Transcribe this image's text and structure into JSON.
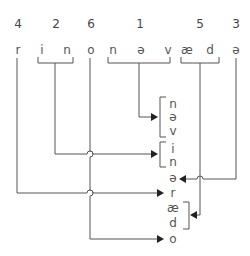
{
  "diagram": {
    "type": "phoneme-reordering",
    "source_row": {
      "order_numbers": [
        {
          "label": "4",
          "x": 18
        },
        {
          "label": "2",
          "x": 56
        },
        {
          "label": "6",
          "x": 91
        },
        {
          "label": "1",
          "x": 140
        },
        {
          "label": "5",
          "x": 200
        },
        {
          "label": "3",
          "x": 236
        }
      ],
      "segments": [
        {
          "text": "r",
          "x": 18
        },
        {
          "text": "i",
          "x": 42
        },
        {
          "text": "n",
          "x": 67
        },
        {
          "text": "o",
          "x": 91
        },
        {
          "text": "n",
          "x": 113
        },
        {
          "text": "ə",
          "x": 141
        },
        {
          "text": "v",
          "x": 168
        },
        {
          "text": "æ",
          "x": 187
        },
        {
          "text": "d",
          "x": 210
        },
        {
          "text": "ə",
          "x": 236
        }
      ]
    },
    "target_column": [
      {
        "text": "n",
        "y": 108,
        "group": "1"
      },
      {
        "text": "ə",
        "y": 121,
        "group": "1"
      },
      {
        "text": "v",
        "y": 135,
        "group": "1"
      },
      {
        "text": "i",
        "y": 153,
        "group": "2"
      },
      {
        "text": "n",
        "y": 166,
        "group": "2"
      },
      {
        "text": "ə",
        "y": 182,
        "group": "3"
      },
      {
        "text": "r",
        "y": 197,
        "group": "4"
      },
      {
        "text": "æ",
        "y": 212,
        "group": "5"
      },
      {
        "text": "d",
        "y": 227,
        "group": "5"
      },
      {
        "text": "o",
        "y": 243,
        "group": "6"
      }
    ],
    "colors": {
      "line": "#555555",
      "arrow": "#222222",
      "text": "#444444"
    }
  }
}
